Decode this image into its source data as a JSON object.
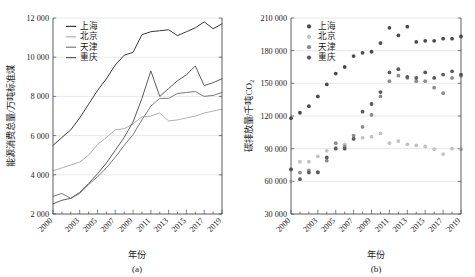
{
  "figure": {
    "panels": [
      {
        "caption": "(a)",
        "xlabel": "年份",
        "ylabel": "能源消费总量/万吨标准煤"
      },
      {
        "caption": "(b)",
        "xlabel": "年份",
        "ylabel_main": "碳排放量/千吨CO",
        "ylabel_sub": "2"
      }
    ]
  },
  "chart_data": [
    {
      "type": "line",
      "panel": "(a)",
      "title": "",
      "xlabel": "年份",
      "ylabel": "能源消费总量/万吨标准煤",
      "xlim": [
        2000,
        2019
      ],
      "ylim": [
        2000,
        12000
      ],
      "yticks": [
        2000,
        4000,
        6000,
        8000,
        10000,
        12000
      ],
      "ytick_labels": [
        "2 000",
        "4 000",
        "6 000",
        "8 000",
        "10 000",
        "12 000"
      ],
      "xticks": [
        2000,
        2003,
        2005,
        2007,
        2009,
        2011,
        2013,
        2015,
        2017,
        2019
      ],
      "xtick_labels": [
        "2000",
        "2003",
        "2005",
        "2007",
        "2009",
        "2011",
        "2013",
        "2015",
        "2017",
        "2019"
      ],
      "grid": true,
      "legend_position": "upper-left",
      "x": [
        2000,
        2001,
        2002,
        2003,
        2004,
        2005,
        2006,
        2007,
        2008,
        2009,
        2010,
        2011,
        2012,
        2013,
        2014,
        2015,
        2016,
        2017,
        2018,
        2019
      ],
      "series": [
        {
          "name": "上海",
          "color": "#3a3a3a",
          "values": [
            5500,
            5900,
            6300,
            6900,
            7600,
            8300,
            8900,
            9600,
            10100,
            10250,
            11150,
            11300,
            11350,
            11400,
            11100,
            11300,
            11500,
            11800,
            11450,
            11700
          ]
        },
        {
          "name": "北京",
          "color": "#b0b0b0",
          "values": [
            4200,
            4350,
            4500,
            4650,
            5000,
            5550,
            5900,
            6300,
            6350,
            6600,
            6950,
            7000,
            7150,
            6750,
            6800,
            6900,
            7000,
            7150,
            7250,
            7350
          ]
        },
        {
          "name": "天津",
          "color": "#7a7a7a",
          "values": [
            2900,
            3050,
            2800,
            3050,
            3500,
            3900,
            4350,
            4900,
            5500,
            6050,
            6800,
            7500,
            7900,
            7900,
            8150,
            8200,
            8250,
            8000,
            8050,
            8200
          ]
        },
        {
          "name": "重庆",
          "color": "#5c5c5c",
          "values": [
            2520,
            2700,
            2800,
            3100,
            3550,
            4050,
            4600,
            5250,
            5900,
            6700,
            7900,
            9300,
            8000,
            8400,
            8800,
            9100,
            9550,
            8550,
            8700,
            8900
          ]
        }
      ]
    },
    {
      "type": "scatter",
      "panel": "(b)",
      "title": "",
      "xlabel": "年份",
      "ylabel": "碳排放量/千吨CO2",
      "xlim": [
        2000,
        2019
      ],
      "ylim": [
        30000,
        210000
      ],
      "yticks": [
        30000,
        60000,
        90000,
        120000,
        150000,
        180000,
        210000
      ],
      "ytick_labels": [
        "30 000",
        "60 000",
        "90 000",
        "120 000",
        "150 000",
        "180 000",
        "210 000"
      ],
      "xticks": [
        2000,
        2003,
        2005,
        2007,
        2009,
        2011,
        2013,
        2015,
        2017,
        2019
      ],
      "xtick_labels": [
        "2000",
        "2003",
        "2005",
        "2007",
        "2009",
        "2011",
        "2013",
        "2015",
        "2017",
        "2019"
      ],
      "grid": true,
      "legend_position": "upper-left",
      "x": [
        2000,
        2001,
        2002,
        2003,
        2004,
        2005,
        2006,
        2007,
        2008,
        2009,
        2010,
        2011,
        2012,
        2013,
        2014,
        2015,
        2016,
        2017,
        2018,
        2019
      ],
      "series": [
        {
          "name": "上海",
          "color": "#4a4a4a",
          "values": [
            118000,
            123000,
            129000,
            138000,
            149000,
            159000,
            165000,
            175000,
            178000,
            179000,
            187000,
            201000,
            194000,
            202000,
            188000,
            189000,
            189000,
            191000,
            191000,
            193000
          ]
        },
        {
          "name": "北京",
          "color": "#c2c2c2",
          "values": [
            60000,
            78000,
            78000,
            83000,
            88000,
            91000,
            94000,
            99000,
            100000,
            101000,
            104000,
            95000,
            97000,
            94000,
            93000,
            92000,
            89500,
            85000,
            90000,
            89500
          ]
        },
        {
          "name": "天津",
          "color": "#8c8c8c",
          "values": [
            71000,
            68000,
            70000,
            68000,
            79000,
            95000,
            92000,
            102000,
            110000,
            121000,
            138000,
            152000,
            157000,
            155000,
            152000,
            152000,
            146000,
            141000,
            155000,
            157000
          ]
        },
        {
          "name": "重庆",
          "color": "#5a5a5a",
          "values": [
            71000,
            62000,
            68000,
            68500,
            82000,
            90000,
            90000,
            99000,
            124000,
            131000,
            142000,
            160000,
            163000,
            156000,
            155000,
            160000,
            155000,
            158000,
            161000,
            158000
          ]
        }
      ]
    }
  ]
}
